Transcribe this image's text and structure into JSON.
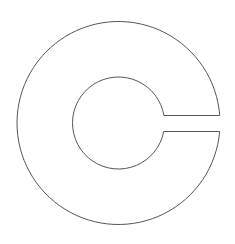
{
  "diagram": {
    "shape": "c-ring-outline",
    "stroke_color": "#555555",
    "fill_color": "#ffffff",
    "background_color": "#ffffff"
  }
}
